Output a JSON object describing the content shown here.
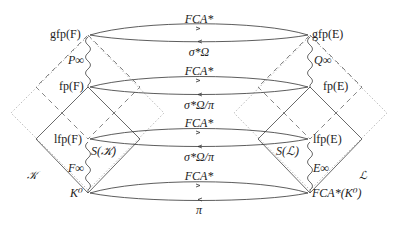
{
  "diagram": {
    "left_nodes": [
      {
        "id": "gfpF",
        "label": "gfp(F)"
      },
      {
        "id": "fpF",
        "label": "fp(F)"
      },
      {
        "id": "lfpF",
        "label": "lfp(F)"
      },
      {
        "id": "K0",
        "label": "K⁰"
      }
    ],
    "right_nodes": [
      {
        "id": "gfpE",
        "label": "gfp(E)"
      },
      {
        "id": "fpE",
        "label": "fp(E)"
      },
      {
        "id": "lfpE",
        "label": "lfp(E)"
      },
      {
        "id": "FCAK0",
        "label": "FCA*(K⁰)"
      }
    ],
    "arrow_pairs": [
      {
        "top_label": "FCA*",
        "bottom_label": "σ*Ω"
      },
      {
        "top_label": "FCA*",
        "bottom_label": "σ*Ω/π"
      },
      {
        "top_label": "FCA*",
        "bottom_label": "σ*Ω/π"
      },
      {
        "top_label": "FCA*",
        "bottom_label": "π"
      }
    ],
    "wavy_labels": {
      "left_upper": "P∞",
      "left_lower": "F∞",
      "right_upper": "Q∞",
      "right_lower": "E∞"
    },
    "region_labels": {
      "left_set": "𝒦",
      "right_set": "ℒ",
      "left_S": "S(𝒦)",
      "right_S": "S(ℒ)"
    },
    "colors": {
      "line": "#333333",
      "dashed": "#555555",
      "dotted": "#999999"
    }
  }
}
